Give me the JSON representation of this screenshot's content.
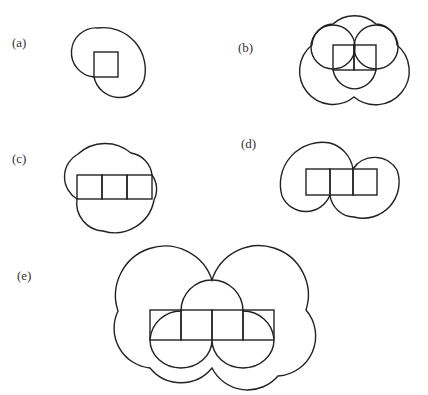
{
  "figure": {
    "panels": [
      {
        "id": "a",
        "label": "(a)",
        "cells": 1,
        "arrangement": "single square"
      },
      {
        "id": "b",
        "label": "(b)",
        "cells": 2,
        "arrangement": "domino (1x2)"
      },
      {
        "id": "c",
        "label": "(c)",
        "cells": 3,
        "arrangement": "straight tromino (1x3)"
      },
      {
        "id": "d",
        "label": "(d)",
        "cells": 3,
        "arrangement": "straight tromino (1x3)"
      },
      {
        "id": "e",
        "label": "(e)",
        "cells": 4,
        "arrangement": "straight tetromino (1x4)"
      }
    ],
    "colors": {
      "stroke": "#222222",
      "background": "#ffffff",
      "label": "#333333"
    }
  }
}
